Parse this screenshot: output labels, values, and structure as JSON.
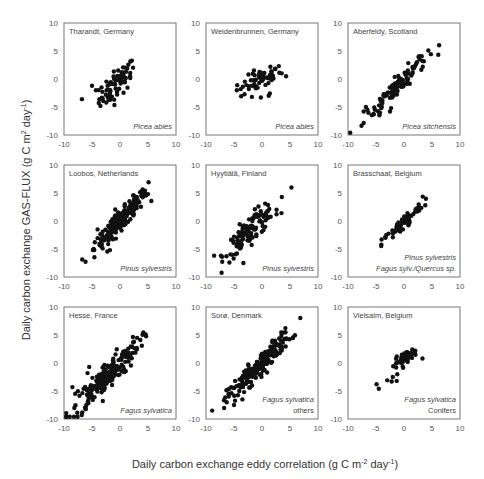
{
  "chart_data": {
    "type": "scatter",
    "layout": {
      "rows": 3,
      "cols": 3,
      "grid": false,
      "legend": "none"
    },
    "xlabel": "Daily carbon exchange eddy correlation (g C m-2 day-1)",
    "ylabel": "Daily carbon exchange GAS-FLUX (g C m-2 day-1)",
    "xlim": [
      -10,
      10
    ],
    "ylim": [
      -10,
      10
    ],
    "xticks": [
      -10,
      -5,
      0,
      5,
      10
    ],
    "yticks": [
      -10,
      -5,
      0,
      5,
      10
    ],
    "panels": [
      {
        "site": "Tharandt, Germany",
        "species": [
          "Picea abies"
        ],
        "species_style": [
          "italic"
        ],
        "center": [
          -0.5,
          -0.8
        ],
        "spread": [
          1.6,
          1.3
        ],
        "slope": 0.85,
        "n": 70,
        "outliers": [
          [
            -6.8,
            -3.6
          ],
          [
            -5,
            -1.2
          ],
          [
            -4.3,
            -2
          ],
          [
            -3.5,
            -4.8
          ],
          [
            -3.3,
            -1.5
          ],
          [
            1.8,
            0.5
          ],
          [
            0.3,
            1.2
          ]
        ]
      },
      {
        "site": "Weidenbrunnen, Germany",
        "species": [
          "Picea abies"
        ],
        "species_style": [
          "italic"
        ],
        "center": [
          -0.3,
          -0.2
        ],
        "spread": [
          1.8,
          0.9
        ],
        "slope": 0.45,
        "n": 55,
        "outliers": [
          [
            -4.5,
            -2
          ],
          [
            -3.8,
            -1.8
          ],
          [
            -1.8,
            -3.2
          ],
          [
            -0.2,
            -3.3
          ],
          [
            1.2,
            -3
          ],
          [
            1.4,
            -2.6
          ],
          [
            1.5,
            2.2
          ],
          [
            3,
            2.3
          ],
          [
            4.3,
            0.5
          ]
        ]
      },
      {
        "site": "Aberfeldy, Scotland",
        "species": [
          "Picea sitchensis"
        ],
        "species_style": [
          "italic"
        ],
        "center": [
          -1.5,
          -1.5
        ],
        "spread": [
          2.8,
          0.9
        ],
        "slope": 1.0,
        "n": 110,
        "outliers": [
          [
            -7.2,
            -5.8
          ],
          [
            -6.8,
            -5
          ],
          [
            -5.2,
            -5.5
          ],
          [
            -4.3,
            -6
          ],
          [
            -2.5,
            -5.8
          ],
          [
            -2.3,
            -5.2
          ],
          [
            2.8,
            3.5
          ],
          [
            2.3,
            3
          ]
        ]
      },
      {
        "site": "Loobos, Netherlands",
        "species": [
          "Pinus sylvestris"
        ],
        "species_style": [
          "italic"
        ],
        "center": [
          0.2,
          0.2
        ],
        "spread": [
          2.4,
          0.9
        ],
        "slope": 1.05,
        "n": 200,
        "outliers": [
          [
            -4.5,
            -3.8
          ],
          [
            -4,
            -1.5
          ],
          [
            -1.8,
            -5.2
          ],
          [
            5,
            4.8
          ],
          [
            3.8,
            4.5
          ],
          [
            -2.8,
            -3
          ]
        ]
      },
      {
        "site": "Hyytiälä, Finland",
        "species": [
          "Pinus sylvestris"
        ],
        "species_style": [
          "italic"
        ],
        "center": [
          -2,
          -1.5
        ],
        "spread": [
          2.3,
          1.2
        ],
        "slope": 0.9,
        "n": 120,
        "outliers": [
          [
            2.6,
            2
          ],
          [
            2.6,
            1.2
          ],
          [
            -4.5,
            -4.5
          ],
          [
            -5.2,
            -3.5
          ]
        ]
      },
      {
        "site": "Brasschaat, Belgium",
        "species": [
          "Pinus sylvestris",
          "Fagus sylv./Quercus sp."
        ],
        "species_style": [
          "italic",
          "italic"
        ],
        "center": [
          -0.3,
          -0.5
        ],
        "spread": [
          1.8,
          0.6
        ],
        "slope": 1.0,
        "n": 60,
        "outliers": [
          [
            -4,
            -3.3
          ],
          [
            -3.3,
            -3
          ],
          [
            3.8,
            2.8
          ],
          [
            2.8,
            2.3
          ],
          [
            -0.2,
            -1.5
          ]
        ]
      },
      {
        "site": "Hesse, France",
        "species": [
          "Fagus sylvatica"
        ],
        "species_style": [
          "italic"
        ],
        "center": [
          -2.5,
          -2.5
        ],
        "spread": [
          3.0,
          1.3
        ],
        "slope": 1.0,
        "n": 190,
        "outliers": [
          [
            -8.5,
            -4.3
          ],
          [
            -8,
            -5.5
          ],
          [
            -6,
            -7.5
          ],
          [
            -5.5,
            -0.7
          ],
          [
            -5.8,
            -1.8
          ],
          [
            2.5,
            3.8
          ],
          [
            3,
            2.7
          ]
        ]
      },
      {
        "site": "Sorø, Denmark",
        "species": [
          "Fagus sylvatica",
          "others"
        ],
        "species_style": [
          "italic",
          "normal"
        ],
        "center": [
          -0.5,
          -0.5
        ],
        "spread": [
          2.8,
          1.0
        ],
        "slope": 1.0,
        "n": 190,
        "outliers": [
          [
            -6.3,
            -7
          ],
          [
            -5,
            -7.5
          ],
          [
            -5.5,
            -4.3
          ],
          [
            -4.8,
            -3.2
          ],
          [
            -3.5,
            -6.5
          ],
          [
            -3.2,
            -5.2
          ],
          [
            4.2,
            5.5
          ]
        ]
      },
      {
        "site": "Vielsalm, Belgium",
        "species": [
          "Fagus sylvatica",
          "Conifers"
        ],
        "species_style": [
          "italic",
          "normal"
        ],
        "center": [
          0.3,
          1.0
        ],
        "spread": [
          1.0,
          0.5
        ],
        "slope": 0.6,
        "n": 50,
        "outliers": [
          [
            -4.9,
            -3.8
          ],
          [
            -4.5,
            -4.6
          ],
          [
            -3,
            -3.1
          ],
          [
            -2.2,
            -3.3
          ],
          [
            -2,
            -2.5
          ],
          [
            -1.3,
            -3.2
          ],
          [
            -1.2,
            -2
          ],
          [
            -1.4,
            -0.8
          ],
          [
            3.3,
            0.8
          ]
        ]
      }
    ]
  },
  "labels": {
    "xlabel_main": "Daily carbon exchange eddy correlation (g C m",
    "xlabel_exp1": "-2",
    "xlabel_mid": " day",
    "xlabel_exp2": "-1",
    "xlabel_end": ")",
    "ylabel_main": "Daily carbon exchange GAS-FLUX (g C m",
    "ylabel_exp1": "2",
    "ylabel_mid": " day",
    "ylabel_exp2": "-1",
    "ylabel_end": ")"
  }
}
